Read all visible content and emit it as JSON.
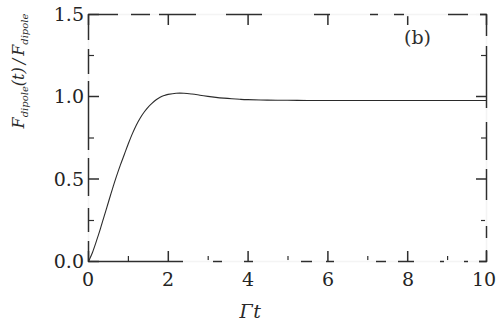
{
  "figure": {
    "panel_label": "(b)",
    "background_color": "#ffffff",
    "ink_color": "#2b2b2b"
  },
  "chart_data": {
    "type": "line",
    "title": "",
    "subtitle": "",
    "panel": "(b)",
    "xlabel": "Γt",
    "ylabel": "F dipole(t) / F dipole",
    "ylabel_parts": {
      "numerator_main": "F",
      "numerator_sub": "dipole",
      "numerator_arg": "(t)",
      "separator": "/",
      "denominator_main": "F",
      "denominator_sub": "dipole"
    },
    "xlim": [
      0,
      10
    ],
    "ylim": [
      0.0,
      1.5
    ],
    "xticks": [
      0,
      2,
      4,
      6,
      8,
      10
    ],
    "xtick_labels": [
      "0",
      "2",
      "4",
      "6",
      "8",
      "10"
    ],
    "yticks": [
      0.0,
      0.5,
      1.0,
      1.5
    ],
    "ytick_labels": [
      "0.0",
      "0.5",
      "1.0",
      "1.5"
    ],
    "x_minor_ticks": [
      1,
      3,
      5,
      7,
      9
    ],
    "y_minor_ticks": [
      0.25,
      0.75,
      1.25
    ],
    "grid": false,
    "legend": false,
    "legend_position": "none",
    "frame": "box",
    "series": [
      {
        "name": "dipole force ratio",
        "color": "#2b2b2b",
        "linewidth": 1.1,
        "x": [
          0.0,
          0.1,
          0.2,
          0.3,
          0.4,
          0.5,
          0.6,
          0.7,
          0.8,
          0.9,
          1.0,
          1.1,
          1.2,
          1.3,
          1.4,
          1.5,
          1.6,
          1.7,
          1.8,
          1.9,
          2.0,
          2.2,
          2.4,
          2.6,
          2.8,
          3.0,
          3.2,
          3.4,
          3.6,
          3.8,
          4.0,
          4.5,
          5.0,
          5.5,
          6.0,
          6.5,
          7.0,
          7.5,
          8.0,
          8.5,
          9.0,
          9.5,
          10.0
        ],
        "y": [
          0.0,
          0.055,
          0.125,
          0.2,
          0.28,
          0.36,
          0.44,
          0.515,
          0.585,
          0.65,
          0.715,
          0.775,
          0.828,
          0.872,
          0.908,
          0.938,
          0.962,
          0.982,
          0.997,
          1.008,
          1.015,
          1.022,
          1.022,
          1.017,
          1.01,
          1.003,
          0.997,
          0.992,
          0.988,
          0.985,
          0.983,
          0.98,
          0.979,
          0.978,
          0.978,
          0.978,
          0.978,
          0.978,
          0.978,
          0.978,
          0.978,
          0.978,
          0.978
        ]
      }
    ],
    "annotations": [
      {
        "text": "(b)",
        "x": 7.9,
        "y": 1.38
      }
    ]
  }
}
